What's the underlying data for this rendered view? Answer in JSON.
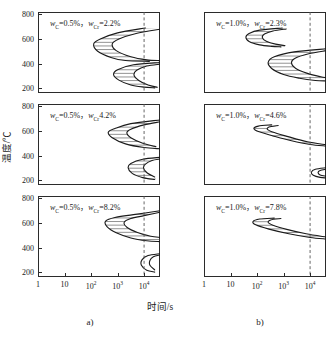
{
  "figure": {
    "axis_x_title": "时间/s",
    "axis_y_title": "温度/℃",
    "subcaption_a": "a)",
    "subcaption_b": "b)",
    "accent_curve_color": "#1a1a1a",
    "hatch_color": "#4a4a4a",
    "dashed_line_color": "#555555",
    "frame_color": "#2b2b2b"
  },
  "axes": {
    "x_ticks": [
      {
        "label": "1",
        "exp": "",
        "value": 0
      },
      {
        "label": "10",
        "exp": "",
        "value": 1
      },
      {
        "label": "10",
        "exp": "2",
        "value": 2
      },
      {
        "label": "10",
        "exp": "3",
        "value": 3
      },
      {
        "label": "10",
        "exp": "4",
        "value": 4
      }
    ],
    "x_min": 0,
    "x_max": 4.6,
    "x_scale": "log10",
    "y_ticks": [
      "800",
      "600",
      "400",
      "200"
    ],
    "y_min": 160,
    "y_max": 820,
    "y_unit": "℃",
    "x_unit": "s",
    "dashed_marker_value": 4
  },
  "chart_data": {
    "type": "line",
    "title": "",
    "xlabel": "时间/s",
    "ylabel": "温度/℃",
    "xlim": [
      0,
      4.6
    ],
    "ylim": [
      160,
      820
    ],
    "xscale": "log10",
    "grid": false,
    "legend": "none",
    "panels": [
      {
        "id": "a1",
        "column": "a",
        "row": 1,
        "label": "w_C=0.5%，w_Cr=2.2%",
        "label_parts": {
          "c_symbol": "w",
          "c_sub": "C",
          "c_value": "=0.5%",
          "sep": "，",
          "cr_symbol": "w",
          "cr_sub": "Cr",
          "cr_value": "=2.2%"
        },
        "curves": [
          {
            "name": "pearlite-start",
            "points": [
              [
                4.05,
                690
              ],
              [
                3.0,
                650
              ],
              [
                2.35,
                600
              ],
              [
                2.1,
                560
              ],
              [
                2.25,
                500
              ],
              [
                2.75,
                450
              ],
              [
                3.3,
                425
              ],
              [
                4.2,
                418
              ]
            ]
          },
          {
            "name": "pearlite-finish",
            "points": [
              [
                4.6,
                680
              ],
              [
                3.7,
                645
              ],
              [
                3.05,
                600
              ],
              [
                2.8,
                560
              ],
              [
                2.95,
                505
              ],
              [
                3.5,
                455
              ],
              [
                4.1,
                430
              ],
              [
                4.6,
                424
              ]
            ]
          },
          {
            "name": "bainite-start",
            "points": [
              [
                4.6,
                408
              ],
              [
                3.6,
                390
              ],
              [
                3.0,
                350
              ],
              [
                2.85,
                310
              ],
              [
                3.05,
                265
              ],
              [
                3.5,
                225
              ],
              [
                4.0,
                208
              ],
              [
                4.4,
                202
              ]
            ]
          },
          {
            "name": "bainite-finish",
            "points": [
              [
                4.6,
                395
              ],
              [
                4.1,
                380
              ],
              [
                3.72,
                345
              ],
              [
                3.62,
                305
              ],
              [
                3.8,
                262
              ],
              [
                4.15,
                225
              ],
              [
                4.5,
                207
              ]
            ]
          }
        ],
        "hatched_bands": [
          {
            "between": [
              "pearlite-start",
              "pearlite-finish"
            ],
            "y_range": [
              418,
              690
            ]
          },
          {
            "between": [
              "bainite-start",
              "bainite-finish"
            ],
            "y_range": [
              202,
              408
            ]
          }
        ]
      },
      {
        "id": "a2",
        "column": "a",
        "row": 2,
        "label": "w_C=0.5%，w_Cr4.2%",
        "label_parts": {
          "c_symbol": "w",
          "c_sub": "C",
          "c_value": "=0.5%",
          "sep": "，",
          "cr_symbol": "w",
          "cr_sub": "Cr",
          "cr_value": "4.2%"
        },
        "curves": [
          {
            "name": "pearlite-start",
            "points": [
              [
                4.6,
                690
              ],
              [
                3.5,
                660
              ],
              [
                2.9,
                620
              ],
              [
                2.65,
                590
              ],
              [
                2.8,
                545
              ],
              [
                3.3,
                495
              ],
              [
                4.0,
                465
              ],
              [
                4.6,
                455
              ]
            ]
          },
          {
            "name": "pearlite-finish",
            "points": [
              [
                4.6,
                675
              ],
              [
                4.0,
                650
              ],
              [
                3.5,
                615
              ],
              [
                3.35,
                585
              ],
              [
                3.5,
                545
              ],
              [
                3.95,
                500
              ],
              [
                4.45,
                472
              ]
            ]
          },
          {
            "name": "bainite-start",
            "points": [
              [
                4.6,
                385
              ],
              [
                3.95,
                370
              ],
              [
                3.5,
                335
              ],
              [
                3.4,
                300
              ],
              [
                3.55,
                255
              ],
              [
                3.95,
                220
              ],
              [
                4.4,
                205
              ]
            ]
          },
          {
            "name": "bainite-finish",
            "points": [
              [
                4.6,
                372
              ],
              [
                4.3,
                360
              ],
              [
                4.05,
                330
              ],
              [
                3.98,
                298
              ],
              [
                4.12,
                258
              ],
              [
                4.4,
                226
              ]
            ]
          }
        ],
        "hatched_bands": [
          {
            "between": [
              "pearlite-start",
              "pearlite-finish"
            ],
            "y_range": [
              455,
              690
            ]
          },
          {
            "between": [
              "bainite-start",
              "bainite-finish"
            ],
            "y_range": [
              205,
              385
            ]
          }
        ]
      },
      {
        "id": "a3",
        "column": "a",
        "row": 3,
        "label": "w_C=0.5%，w_Cr=8.2%",
        "label_parts": {
          "c_symbol": "w",
          "c_sub": "C",
          "c_value": "=0.5%",
          "sep": "，",
          "cr_symbol": "w",
          "cr_sub": "Cr",
          "cr_value": "=8.2%"
        },
        "curves": [
          {
            "name": "pearlite-start",
            "points": [
              [
                4.6,
                700
              ],
              [
                3.6,
                668
              ],
              [
                2.9,
                645
              ],
              [
                2.55,
                615
              ],
              [
                2.6,
                570
              ],
              [
                2.95,
                520
              ],
              [
                3.5,
                478
              ],
              [
                4.1,
                455
              ],
              [
                4.6,
                448
              ]
            ]
          },
          {
            "name": "pearlite-finish",
            "points": [
              [
                4.6,
                688
              ],
              [
                4.0,
                660
              ],
              [
                3.5,
                636
              ],
              [
                3.25,
                605
              ],
              [
                3.35,
                565
              ],
              [
                3.75,
                522
              ],
              [
                4.25,
                492
              ],
              [
                4.6,
                482
              ]
            ]
          },
          {
            "name": "bainite-start",
            "points": [
              [
                4.6,
                350
              ],
              [
                4.15,
                335
              ],
              [
                3.92,
                300
              ],
              [
                3.9,
                255
              ],
              [
                4.1,
                215
              ],
              [
                4.4,
                200
              ]
            ]
          },
          {
            "name": "bainite-finish",
            "points": [
              [
                4.6,
                340
              ],
              [
                4.35,
                325
              ],
              [
                4.22,
                295
              ],
              [
                4.22,
                255
              ],
              [
                4.4,
                218
              ]
            ]
          }
        ],
        "hatched_bands": [
          {
            "between": [
              "pearlite-start",
              "pearlite-finish"
            ],
            "y_range": [
              448,
              700
            ]
          }
        ]
      },
      {
        "id": "b1",
        "column": "b",
        "row": 1,
        "label": "w_C=1.0%，w_Cr=2.3%",
        "label_parts": {
          "c_symbol": "w",
          "c_sub": "C",
          "c_value": "=1.0%",
          "sep": "，",
          "cr_symbol": "w",
          "cr_sub": "Cr",
          "cr_value": "=2.3%"
        },
        "curves": [
          {
            "name": "pearlite-start",
            "points": [
              [
                2.95,
                690
              ],
              [
                2.1,
                672
              ],
              [
                1.7,
                645
              ],
              [
                1.58,
                615
              ],
              [
                1.7,
                580
              ],
              [
                2.1,
                552
              ],
              [
                2.55,
                540
              ],
              [
                2.9,
                536
              ]
            ]
          },
          {
            "name": "pearlite-finish",
            "points": [
              [
                3.1,
                682
              ],
              [
                2.6,
                665
              ],
              [
                2.28,
                640
              ],
              [
                2.2,
                612
              ],
              [
                2.35,
                582
              ],
              [
                2.7,
                558
              ],
              [
                3.05,
                546
              ]
            ]
          },
          {
            "name": "bainite-start",
            "points": [
              [
                4.6,
                520
              ],
              [
                3.4,
                495
              ],
              [
                2.65,
                455
              ],
              [
                2.42,
                410
              ],
              [
                2.55,
                360
              ],
              [
                3.0,
                310
              ],
              [
                3.6,
                280
              ],
              [
                4.2,
                262
              ],
              [
                4.6,
                258
              ]
            ]
          },
          {
            "name": "bainite-finish",
            "points": [
              [
                4.6,
                505
              ],
              [
                3.95,
                480
              ],
              [
                3.42,
                442
              ],
              [
                3.3,
                405
              ],
              [
                3.45,
                362
              ],
              [
                3.9,
                320
              ],
              [
                4.4,
                292
              ],
              [
                4.6,
                286
              ]
            ]
          }
        ],
        "hatched_bands": [
          {
            "between": [
              "pearlite-start",
              "pearlite-finish"
            ],
            "y_range": [
              536,
              690
            ]
          },
          {
            "between": [
              "bainite-start",
              "bainite-finish"
            ],
            "y_range": [
              258,
              520
            ]
          }
        ]
      },
      {
        "id": "b2",
        "column": "b",
        "row": 2,
        "label": "w_C=1.0%，w_Cr=4.6%",
        "label_parts": {
          "c_symbol": "w",
          "c_sub": "C",
          "c_value": "=1.0%",
          "sep": "，",
          "cr_symbol": "w",
          "cr_sub": "Cr",
          "cr_value": "=4.6%"
        },
        "curves": [
          {
            "name": "pearlite-start",
            "points": [
              [
                2.55,
                650
              ],
              [
                2.05,
                640
              ],
              [
                1.88,
                620
              ],
              [
                2.05,
                595
              ],
              [
                2.6,
                560
              ],
              [
                3.3,
                520
              ],
              [
                4.0,
                490
              ],
              [
                4.6,
                478
              ]
            ]
          },
          {
            "name": "pearlite-finish",
            "points": [
              [
                2.8,
                645
              ],
              [
                2.45,
                632
              ],
              [
                2.4,
                612
              ],
              [
                2.65,
                588
              ],
              [
                3.2,
                552
              ],
              [
                3.9,
                512
              ],
              [
                4.6,
                488
              ]
            ]
          },
          {
            "name": "bainite-start",
            "points": [
              [
                4.6,
                300
              ],
              [
                4.2,
                288
              ],
              [
                4.05,
                265
              ],
              [
                4.12,
                240
              ],
              [
                4.38,
                222
              ],
              [
                4.6,
                218
              ]
            ]
          },
          {
            "name": "bainite-finish",
            "points": [
              [
                4.6,
                288
              ],
              [
                4.38,
                278
              ],
              [
                4.3,
                262
              ],
              [
                4.38,
                242
              ],
              [
                4.6,
                232
              ]
            ]
          }
        ],
        "hatched_bands": [
          {
            "between": [
              "pearlite-start",
              "pearlite-finish"
            ],
            "y_range": [
              478,
              650
            ]
          }
        ]
      },
      {
        "id": "b3",
        "column": "b",
        "row": 3,
        "label": "w_C=1.0%，w_Cr=7.8%",
        "label_parts": {
          "c_symbol": "w",
          "c_sub": "C",
          "c_value": "=1.0%",
          "sep": "，",
          "cr_symbol": "w",
          "cr_sub": "Cr",
          "cr_value": "=7.8%"
        },
        "curves": [
          {
            "name": "pearlite-start",
            "points": [
              [
                2.65,
                640
              ],
              [
                2.1,
                632
              ],
              [
                1.85,
                612
              ],
              [
                1.95,
                585
              ],
              [
                2.45,
                550
              ],
              [
                3.2,
                512
              ],
              [
                4.0,
                482
              ],
              [
                4.6,
                470
              ]
            ]
          },
          {
            "name": "pearlite-finish",
            "points": [
              [
                2.9,
                636
              ],
              [
                2.52,
                625
              ],
              [
                2.42,
                605
              ],
              [
                2.6,
                582
              ],
              [
                3.12,
                548
              ],
              [
                3.85,
                512
              ],
              [
                4.6,
                486
              ]
            ]
          }
        ],
        "hatched_bands": [
          {
            "between": [
              "pearlite-start",
              "pearlite-finish"
            ],
            "y_range": [
              470,
              640
            ]
          }
        ]
      }
    ]
  }
}
